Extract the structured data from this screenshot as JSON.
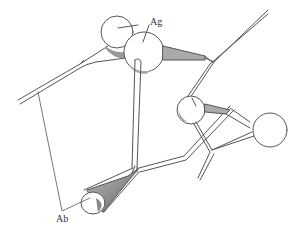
{
  "diagram": {
    "type": "antibody-antigen schematic line drawing",
    "labels": {
      "antigen": "Ag",
      "antibody": "Ab"
    },
    "colors": {
      "stroke": "#555555",
      "shade": "#999999",
      "background": "#ffffff"
    }
  }
}
